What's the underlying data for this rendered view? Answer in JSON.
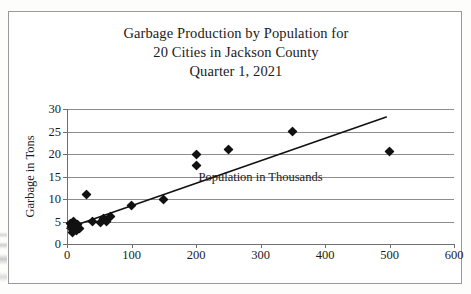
{
  "figure": {
    "title_lines": [
      "Garbage Production by Population for",
      "20 Cities in Jackson County",
      "Quarter 1, 2021"
    ],
    "title_full": "Garbage Production by Population for 20 Cities in Jackson County Quarter 1, 2021"
  },
  "chart_data": {
    "type": "scatter",
    "title": "Garbage Production by Population for 20 Cities in Jackson County Quarter 1, 2021",
    "xlabel": "Population in Thousands",
    "ylabel": "Garbage in Tons",
    "xlim": [
      0,
      600
    ],
    "ylim": [
      0,
      30
    ],
    "xticks": [
      0,
      100,
      200,
      300,
      400,
      500,
      600
    ],
    "yticks": [
      0,
      5,
      10,
      15,
      20,
      25,
      30
    ],
    "xtick_labels": [
      "0",
      "100",
      "200",
      "300",
      "400",
      "500",
      "600"
    ],
    "ytick_labels": [
      "0",
      "5",
      "10",
      "15",
      "20",
      "25",
      "30"
    ],
    "grid": "horizontal",
    "legend": "none",
    "marker": "diamond",
    "marker_color": "#111111",
    "n_points": 20,
    "points": [
      {
        "x": 5,
        "y": 4.6
      },
      {
        "x": 7,
        "y": 4.0
      },
      {
        "x": 8,
        "y": 3.2
      },
      {
        "x": 9,
        "y": 2.6
      },
      {
        "x": 10,
        "y": 4.9
      },
      {
        "x": 12,
        "y": 3.7
      },
      {
        "x": 14,
        "y": 2.9
      },
      {
        "x": 16,
        "y": 4.3
      },
      {
        "x": 20,
        "y": 3.4
      },
      {
        "x": 30,
        "y": 11.0
      },
      {
        "x": 40,
        "y": 5.1
      },
      {
        "x": 52,
        "y": 4.8
      },
      {
        "x": 56,
        "y": 5.6
      },
      {
        "x": 62,
        "y": 5.0
      },
      {
        "x": 68,
        "y": 6.2
      },
      {
        "x": 100,
        "y": 8.5
      },
      {
        "x": 150,
        "y": 10.0
      },
      {
        "x": 200,
        "y": 20.0
      },
      {
        "x": 200,
        "y": 17.5
      },
      {
        "x": 250,
        "y": 21.0
      },
      {
        "x": 350,
        "y": 25.0
      },
      {
        "x": 500,
        "y": 20.5
      }
    ],
    "trendline": {
      "type": "linear",
      "x_start": 0,
      "y_start": 3.5,
      "x_end": 495,
      "y_end": 28.2,
      "color": "#111111"
    }
  }
}
